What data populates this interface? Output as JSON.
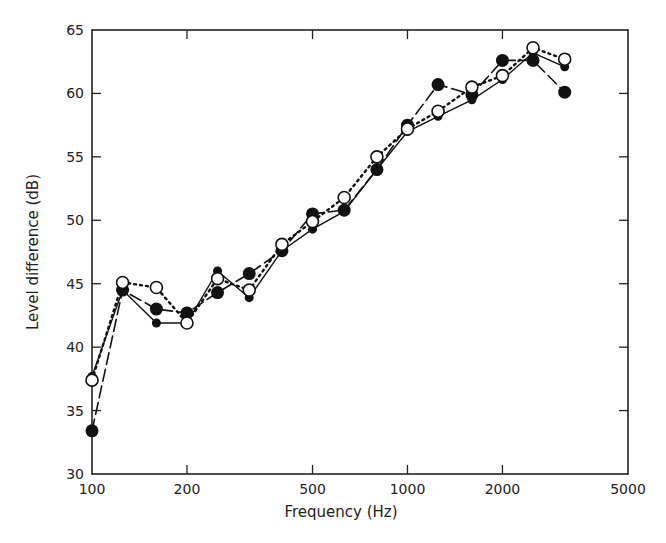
{
  "chart_data": {
    "type": "line",
    "title": "",
    "xlabel": "Frequency (Hz)",
    "ylabel": "Level difference (dB)",
    "xscale": "log",
    "xlim": [
      100,
      5000
    ],
    "ylim": [
      30,
      65
    ],
    "xticks": [
      100,
      200,
      500,
      1000,
      2000,
      5000
    ],
    "xtick_labels": [
      "100",
      "200",
      "500",
      "1000",
      "2000",
      "5000"
    ],
    "yticks": [
      30,
      35,
      40,
      45,
      50,
      55,
      60,
      65
    ],
    "ytick_labels": [
      "30",
      "35",
      "40",
      "45",
      "50",
      "55",
      "60",
      "65"
    ],
    "grid": false,
    "legend": null,
    "x": [
      100,
      125,
      160,
      200,
      250,
      315,
      400,
      500,
      630,
      800,
      1000,
      1250,
      1600,
      2000,
      2500,
      3150
    ],
    "series": [
      {
        "name": "solid line, small filled circles",
        "line": "solid",
        "marker": "filled-small",
        "values": [
          37.7,
          44.5,
          41.9,
          41.9,
          46.0,
          43.9,
          47.6,
          49.3,
          50.7,
          54.0,
          57.0,
          58.2,
          59.5,
          61.1,
          63.2,
          62.1
        ]
      },
      {
        "name": "dashed line, large filled circles",
        "line": "dashed",
        "marker": "filled-large",
        "values": [
          33.4,
          44.5,
          43.0,
          42.7,
          44.3,
          45.8,
          47.6,
          50.5,
          50.8,
          54.0,
          57.5,
          60.7,
          59.9,
          62.6,
          62.6,
          60.1
        ]
      },
      {
        "name": "dotted line, open circles",
        "line": "dotted",
        "marker": "open",
        "values": [
          37.4,
          45.1,
          44.7,
          41.9,
          45.4,
          44.5,
          48.1,
          49.9,
          51.8,
          55.0,
          57.2,
          58.6,
          60.5,
          61.4,
          63.6,
          62.7
        ]
      }
    ]
  }
}
